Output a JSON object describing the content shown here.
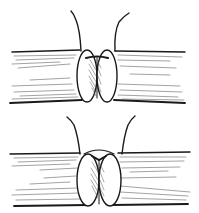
{
  "figure": {
    "panels": [
      {
        "id": "top",
        "label": "Stage 1: suture ends raised, vessel ends approximated"
      },
      {
        "id": "bottom",
        "label": "Stage 2: sutures tied, ends everted together"
      }
    ],
    "colors": {
      "ink": "#1a1a1a",
      "background": "#ffffff",
      "hatch": "#555555"
    }
  }
}
